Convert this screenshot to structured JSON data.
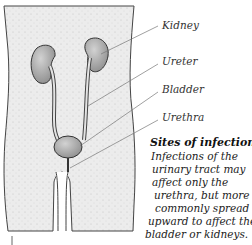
{
  "figure": {
    "labels": {
      "kidney": "Kidney",
      "ureter": "Ureter",
      "bladder": "Bladder",
      "urethra": "Urethra"
    },
    "caption": {
      "title": "Sites of infection",
      "lines": [
        "Infections of the",
        "urinary tract may",
        "affect only the",
        "urethra, but more",
        "commonly spread",
        "upward to affect the",
        "bladder or kidneys."
      ]
    },
    "colors": {
      "body_fill": "#e9e9e9",
      "outline": "#444444",
      "organ_fill": "#a8a8a8",
      "leader_line": "#777777",
      "text": "#222222"
    }
  }
}
